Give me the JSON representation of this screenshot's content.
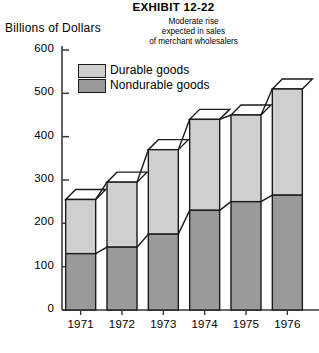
{
  "exhibit": {
    "title": "EXHIBIT 12-22"
  },
  "axis_title": {
    "y": "Billions of Dollars"
  },
  "subtitle": {
    "line1": "Moderate rise",
    "line2": "expected in sales",
    "line3": "of merchant wholesalers"
  },
  "legend": {
    "items": [
      {
        "label": "Durable goods",
        "color": "#cfcfcf"
      },
      {
        "label": "Nondurable goods",
        "color": "#9a9a9a"
      }
    ]
  },
  "colors": {
    "durable": "#cfcfcf",
    "nondurable": "#9a9a9a",
    "outline": "#1a1a1a",
    "axis": "#3a3a3a",
    "background": "#ffffff"
  },
  "chart_data": {
    "type": "bar",
    "title": "EXHIBIT 12-22",
    "subtitle": "Moderate rise expected in sales of merchant wholesalers",
    "xlabel": "",
    "ylabel": "Billions of Dollars",
    "stacked": true,
    "grid": false,
    "legend_position": "upper-left-inside",
    "ylim": [
      0,
      600
    ],
    "yticks": [
      0,
      100,
      200,
      300,
      400,
      500,
      600
    ],
    "ytick_labels": [
      "0",
      "100",
      "200",
      "300",
      "400",
      "500",
      "600"
    ],
    "categories": [
      "1971",
      "1972",
      "1973",
      "1974",
      "1975",
      "1976"
    ],
    "series": [
      {
        "name": "Nondurable goods",
        "color": "#9a9a9a",
        "values": [
          130,
          145,
          175,
          230,
          250,
          265
        ]
      },
      {
        "name": "Durable goods",
        "color": "#cfcfcf",
        "values": [
          125,
          150,
          195,
          210,
          200,
          245
        ]
      }
    ],
    "totals": [
      255,
      295,
      370,
      440,
      450,
      510
    ]
  }
}
